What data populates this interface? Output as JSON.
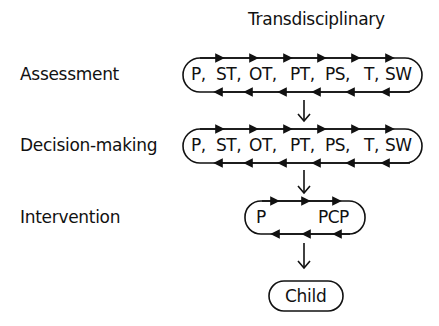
{
  "title": "Transdisciplinary",
  "stages": [
    {
      "label": "Assessment",
      "members": [
        "P,",
        "ST,",
        "OT,",
        "PT,",
        "PS,",
        "T,",
        "SW"
      ]
    },
    {
      "label": "Decision-making",
      "members": [
        "P,",
        "ST,",
        "OT,",
        "PT,",
        "PS,",
        "T,",
        "SW"
      ]
    },
    {
      "label": "Intervention",
      "members": [
        "P",
        "PCP"
      ]
    }
  ],
  "target": "Child",
  "colors": {
    "stroke": "#111111",
    "background": "#ffffff"
  }
}
